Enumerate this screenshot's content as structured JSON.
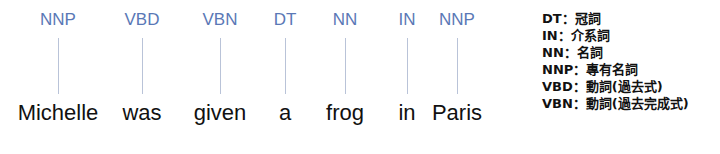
{
  "diagram": {
    "tokens": [
      {
        "word": "Michelle",
        "tag": "NNP",
        "x": 58
      },
      {
        "word": "was",
        "tag": "VBD",
        "x": 142
      },
      {
        "word": "given",
        "tag": "VBN",
        "x": 220
      },
      {
        "word": "a",
        "tag": "DT",
        "x": 285
      },
      {
        "word": "frog",
        "tag": "NN",
        "x": 345
      },
      {
        "word": "in",
        "tag": "IN",
        "x": 407
      },
      {
        "word": "Paris",
        "tag": "NNP",
        "x": 457
      }
    ],
    "legend": [
      "DT：冠詞",
      "IN：介系詞",
      "NN：名詞",
      "NNP：專有名詞",
      "VBD：動詞(過去式)",
      "VBN：動詞(過去完成式)"
    ],
    "colors": {
      "tag": "#5a78b6",
      "connector": "#b9c3d8",
      "word": "#111111"
    }
  }
}
